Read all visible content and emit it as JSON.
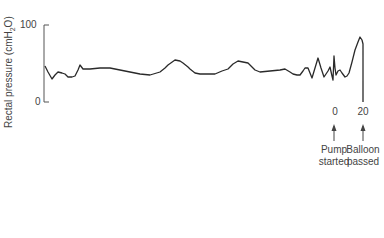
{
  "chart_data": {
    "type": "line",
    "title": "",
    "xlabel": "",
    "ylabel": "Rectal pressure (cmH2O)",
    "ylabel_parts": {
      "prefix": "Rectal pressure (cmH",
      "sub": "2",
      "suffix": "O)"
    },
    "ylim": [
      0,
      100
    ],
    "yticks": [
      "0",
      "100"
    ],
    "grid": false,
    "legend": null,
    "series": [
      {
        "name": "Rectal pressure",
        "color": "#2a2a2a",
        "points_px": [
          [
            45,
            66
          ],
          [
            48,
            72
          ],
          [
            52,
            79
          ],
          [
            55,
            75
          ],
          [
            58,
            72
          ],
          [
            62,
            73
          ],
          [
            65,
            74
          ],
          [
            68,
            77
          ],
          [
            72,
            77
          ],
          [
            75,
            76
          ],
          [
            78,
            70
          ],
          [
            80,
            65
          ],
          [
            83,
            69
          ],
          [
            90,
            69
          ],
          [
            100,
            68
          ],
          [
            110,
            68
          ],
          [
            120,
            70
          ],
          [
            130,
            72
          ],
          [
            140,
            74
          ],
          [
            150,
            75
          ],
          [
            160,
            72
          ],
          [
            165,
            68
          ],
          [
            168,
            65
          ],
          [
            175,
            60
          ],
          [
            180,
            61
          ],
          [
            183,
            63
          ],
          [
            188,
            67
          ],
          [
            190,
            69
          ],
          [
            195,
            73
          ],
          [
            200,
            74
          ],
          [
            208,
            74
          ],
          [
            215,
            74
          ],
          [
            222,
            71
          ],
          [
            228,
            69
          ],
          [
            233,
            64
          ],
          [
            238,
            61
          ],
          [
            243,
            62
          ],
          [
            248,
            63
          ],
          [
            252,
            67
          ],
          [
            255,
            70
          ],
          [
            260,
            72
          ],
          [
            270,
            71
          ],
          [
            280,
            70
          ],
          [
            285,
            69
          ],
          [
            290,
            72
          ],
          [
            293,
            74
          ],
          [
            297,
            75
          ],
          [
            300,
            75
          ],
          [
            303,
            71
          ],
          [
            305,
            68
          ],
          [
            308,
            68
          ],
          [
            310,
            73
          ],
          [
            312,
            78
          ],
          [
            315,
            68
          ],
          [
            318,
            58
          ],
          [
            321,
            68
          ],
          [
            324,
            77
          ],
          [
            326,
            74
          ],
          [
            328,
            71
          ],
          [
            330,
            67
          ],
          [
            332,
            76
          ],
          [
            333,
            80
          ],
          [
            334,
            56
          ],
          [
            335,
            68
          ],
          [
            336,
            75
          ],
          [
            338,
            71
          ],
          [
            340,
            70
          ],
          [
            342,
            73
          ],
          [
            345,
            77
          ],
          [
            347,
            76
          ],
          [
            349,
            73
          ],
          [
            352,
            62
          ],
          [
            355,
            50
          ],
          [
            358,
            42
          ],
          [
            360,
            37
          ],
          [
            362,
            40
          ],
          [
            363,
            44
          ],
          [
            363,
            102
          ]
        ],
        "approx_values": [
          47,
          38,
          30,
          35,
          39,
          38,
          36,
          32,
          33,
          35,
          42,
          48,
          43,
          44,
          44,
          44,
          42,
          39,
          36,
          35,
          39,
          44,
          48,
          55,
          53,
          51,
          45,
          43,
          38,
          36,
          36,
          36,
          40,
          43,
          49,
          53,
          52,
          51,
          45,
          42,
          39,
          40,
          42,
          43,
          39,
          36,
          35,
          35,
          40,
          44,
          44,
          38,
          31,
          44,
          57,
          44,
          32,
          36,
          40,
          45,
          34,
          29,
          60,
          44,
          35,
          40,
          42,
          38,
          32,
          34,
          38,
          52,
          68,
          78,
          84,
          81,
          75,
          0
        ]
      }
    ],
    "annotations": [
      {
        "label": "0",
        "text": [
          "Pump",
          "started"
        ],
        "x_px": 334
      },
      {
        "label": "20",
        "text": [
          "Balloon",
          "passed"
        ],
        "x_px": 363
      }
    ]
  },
  "axis": {
    "y_top_label": "100",
    "y_bottom_label": "0"
  }
}
